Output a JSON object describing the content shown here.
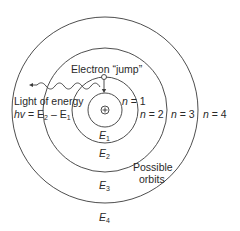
{
  "diagram": {
    "colors": {
      "line": "#3a3a3a",
      "text": "#2a2a2a",
      "background": "#ffffff"
    },
    "nucleus": {
      "symbol": "+",
      "cx": 105,
      "cy": 110
    },
    "orbits": [
      {
        "n_label": "n = 1",
        "n": "1",
        "energy_var": "E",
        "energy_sub": "1",
        "radius": 17
      },
      {
        "n_label": "n = 2",
        "n": "2",
        "energy_var": "E",
        "energy_sub": "2",
        "radius": 33
      },
      {
        "n_label": "n = 3",
        "n": "3",
        "energy_var": "E",
        "energy_sub": "3",
        "radius": 62
      },
      {
        "n_label": "n = 4",
        "n": "4",
        "energy_var": "E",
        "energy_sub": "4",
        "radius": 93
      }
    ],
    "labels": {
      "electron_jump": "Electron “jump”",
      "light_line1": "Light of energy",
      "light_hv": "hv",
      "light_eq": " = E",
      "light_sub2": "2",
      "light_minus": " – E",
      "light_sub1": "1",
      "possible_line1": "Possible",
      "possible_line2": "orbits",
      "n_prefix": "n",
      "eq": " = "
    }
  }
}
